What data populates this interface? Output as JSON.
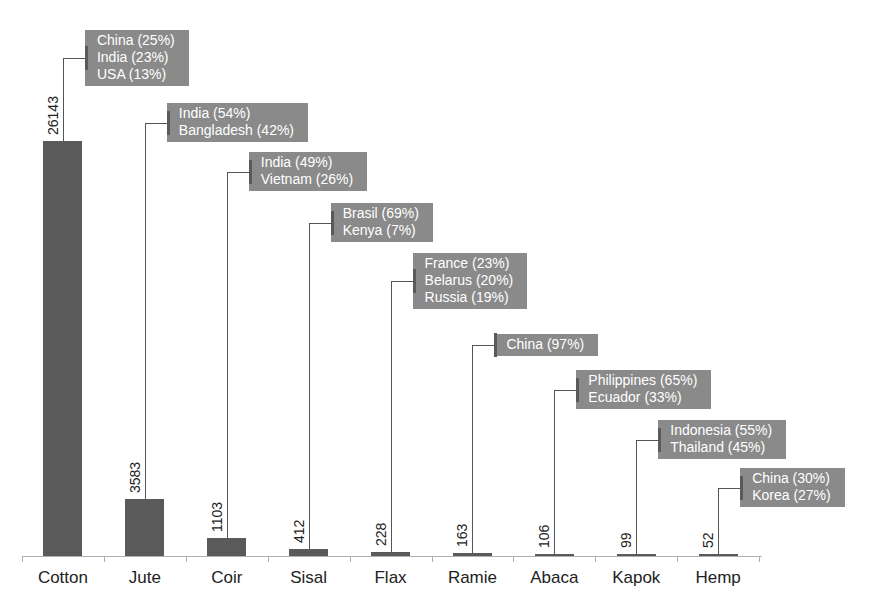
{
  "chart_data": {
    "type": "bar",
    "title": "",
    "xlabel": "",
    "ylabel": "",
    "grid": false,
    "categories": [
      "Cotton",
      "Jute",
      "Coir",
      "Sisal",
      "Flax",
      "Ramie",
      "Abaca",
      "Kapok",
      "Hemp"
    ],
    "values": [
      26143,
      3583,
      1103,
      412,
      228,
      163,
      106,
      99,
      52
    ],
    "value_labels": [
      "26143",
      "3583",
      "1103",
      "412",
      "228",
      "163",
      "106",
      "99",
      "52"
    ],
    "annotations": [
      {
        "category": "Cotton",
        "lines": [
          "China (25%)",
          "India (23%)",
          "USA (13%)"
        ]
      },
      {
        "category": "Jute",
        "lines": [
          "India (54%)",
          "Bangladesh (42%)"
        ]
      },
      {
        "category": "Coir",
        "lines": [
          "India (49%)",
          "Vietnam (26%)"
        ]
      },
      {
        "category": "Sisal",
        "lines": [
          "Brasil (69%)",
          "Kenya (7%)"
        ]
      },
      {
        "category": "Flax",
        "lines": [
          "France (23%)",
          "Belarus (20%)",
          "Russia (19%)"
        ]
      },
      {
        "category": "Ramie",
        "lines": [
          "China (97%)"
        ]
      },
      {
        "category": "Abaca",
        "lines": [
          "Philippines (65%)",
          "Ecuador (33%)"
        ]
      },
      {
        "category": "Kapok",
        "lines": [
          "Indonesia (55%)",
          "Thailand (45%)"
        ]
      },
      {
        "category": "Hemp",
        "lines": [
          "China (30%)",
          "Korea (27%)"
        ]
      }
    ],
    "colors": {
      "bar": "#5a5a5a",
      "annotation_box": "#8a8a8a",
      "annotation_text": "#ffffff"
    },
    "legend": null
  }
}
